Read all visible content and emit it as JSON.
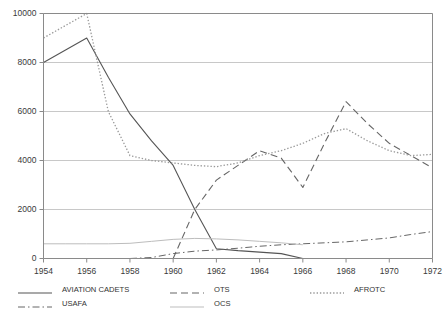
{
  "chart_data": {
    "type": "line",
    "title": "",
    "subtitle": "",
    "xlabel": "",
    "ylabel": "",
    "xlim": [
      1954,
      1972
    ],
    "ylim": [
      0,
      10000
    ],
    "grid": true,
    "legend_position": "bottom",
    "x": [
      1954,
      1955,
      1956,
      1957,
      1958,
      1959,
      1960,
      1961,
      1962,
      1963,
      1964,
      1965,
      1966,
      1967,
      1968,
      1969,
      1970,
      1971,
      1972
    ],
    "xticks": [
      "1954",
      "1956",
      "1958",
      "1960",
      "1962",
      "1964",
      "1966",
      "1968",
      "1970",
      "1972"
    ],
    "yticks": [
      "0",
      "2000",
      "4000",
      "6000",
      "8000",
      "10000"
    ],
    "series": [
      {
        "name": "AVIATION CADETS",
        "style": "solid",
        "color": "#555555",
        "values": [
          8000,
          8500,
          9000,
          7400,
          5900,
          4800,
          3800,
          2000,
          400,
          320,
          260,
          200,
          0,
          null,
          null,
          null,
          null,
          null,
          null
        ]
      },
      {
        "name": "USAFA",
        "style": "dash-dot",
        "color": "#666666",
        "values": [
          null,
          null,
          null,
          null,
          0,
          40,
          200,
          300,
          350,
          420,
          500,
          560,
          600,
          640,
          680,
          760,
          840,
          980,
          1100
        ]
      },
      {
        "name": "OTS",
        "style": "dashed",
        "color": "#666666",
        "values": [
          null,
          null,
          null,
          null,
          null,
          null,
          0,
          2000,
          3200,
          3800,
          4400,
          4100,
          2900,
          4700,
          6400,
          5500,
          4700,
          4200,
          3700
        ]
      },
      {
        "name": "OCS",
        "style": "solid-light",
        "color": "#bdbdbd",
        "values": [
          600,
          600,
          600,
          600,
          620,
          700,
          780,
          820,
          800,
          760,
          700,
          640,
          560,
          null,
          null,
          null,
          null,
          null,
          null
        ]
      },
      {
        "name": "AFROTC",
        "style": "dotted",
        "color": "#999999",
        "values": [
          9000,
          9500,
          10000,
          6000,
          4200,
          4000,
          3900,
          3800,
          3750,
          3900,
          4200,
          4400,
          4700,
          5100,
          5300,
          4800,
          4400,
          4200,
          4250
        ]
      }
    ]
  },
  "legend": {
    "items": [
      {
        "label": "AVIATION CADETS",
        "style": "solid"
      },
      {
        "label": "USAFA",
        "style": "dash-dot"
      },
      {
        "label": "OTS",
        "style": "dashed"
      },
      {
        "label": "OCS",
        "style": "solid-light"
      },
      {
        "label": "AFROTC",
        "style": "dotted"
      }
    ]
  }
}
